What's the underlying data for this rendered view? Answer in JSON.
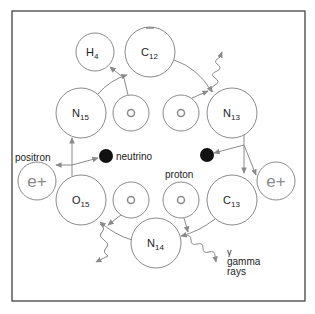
{
  "colors": {
    "stroke": "#8a8a8a",
    "frame": "#333333",
    "text": "#222222",
    "neutrino": "#111111"
  },
  "nuclei": [
    {
      "id": "h4",
      "symbol": "H",
      "mass": "4",
      "cx": 95,
      "cy": 52,
      "r": 19
    },
    {
      "id": "c12",
      "symbol": "C",
      "mass": "12",
      "cx": 150,
      "cy": 52,
      "r": 25
    },
    {
      "id": "n15",
      "symbol": "N",
      "mass": "15",
      "cx": 81,
      "cy": 113,
      "r": 25
    },
    {
      "id": "n13",
      "symbol": "N",
      "mass": "13",
      "cx": 232,
      "cy": 113,
      "r": 25
    },
    {
      "id": "o15",
      "symbol": "O",
      "mass": "15",
      "cx": 81,
      "cy": 200,
      "r": 25
    },
    {
      "id": "c13",
      "symbol": "C",
      "mass": "13",
      "cx": 232,
      "cy": 200,
      "r": 25
    },
    {
      "id": "n14",
      "symbol": "N",
      "mass": "14",
      "cx": 156,
      "cy": 243,
      "r": 25
    }
  ],
  "protons": [
    {
      "cx": 131,
      "cy": 113
    },
    {
      "cx": 181,
      "cy": 113
    },
    {
      "cx": 131,
      "cy": 200
    },
    {
      "cx": 181,
      "cy": 200
    }
  ],
  "positrons": [
    {
      "label": "e+",
      "cx": 37,
      "cy": 181
    },
    {
      "label": "e+",
      "cx": 276,
      "cy": 181
    }
  ],
  "labels": {
    "positron": "positron",
    "neutrino": "neutrino",
    "proton": "proton",
    "gamma_symbol": "γ",
    "gamma": "gamma",
    "rays": "rays"
  }
}
